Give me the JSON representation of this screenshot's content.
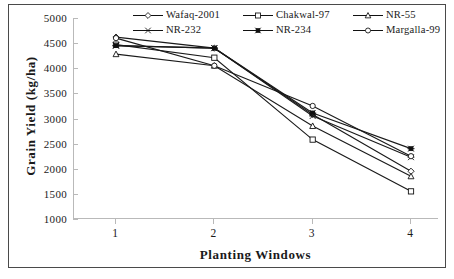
{
  "chart_data": {
    "type": "line",
    "title": "",
    "xlabel": "Planting Windows",
    "ylabel": "Grain Yield (kg/ha)",
    "categories": [
      "1",
      "2",
      "3",
      "4"
    ],
    "x": [
      1,
      2,
      3,
      4
    ],
    "ylim": [
      1000,
      5000
    ],
    "yticks": [
      1000,
      1500,
      2000,
      2500,
      3000,
      3500,
      4000,
      4500,
      5000
    ],
    "ytick_labels": [
      "1000",
      "1500",
      "2000",
      "2500",
      "3000",
      "3500",
      "4000",
      "4500",
      "5000"
    ],
    "grid": false,
    "legend_position": "top-inside",
    "series": [
      {
        "name": "Wafaq-2001",
        "marker": "diamond",
        "values": [
          4620,
          4400,
          3080,
          1950
        ]
      },
      {
        "name": "Chakwal-97",
        "marker": "square",
        "values": [
          4470,
          4210,
          2580,
          1550
        ]
      },
      {
        "name": "NR-55",
        "marker": "triangle",
        "values": [
          4280,
          4050,
          2850,
          1850
        ]
      },
      {
        "name": "NR-232",
        "marker": "cross",
        "values": [
          4450,
          4400,
          3050,
          2230
        ]
      },
      {
        "name": "NR-234",
        "marker": "star-filled",
        "values": [
          4450,
          4400,
          3110,
          2400
        ]
      },
      {
        "name": "Margalla-99",
        "marker": "circle",
        "values": [
          4600,
          4050,
          3250,
          2250
        ]
      }
    ]
  },
  "legend": {
    "items": [
      {
        "label": "Wafaq-2001",
        "marker": "diamond"
      },
      {
        "label": "Chakwal-97",
        "marker": "square"
      },
      {
        "label": "NR-55",
        "marker": "triangle"
      },
      {
        "label": "NR-232",
        "marker": "cross"
      },
      {
        "label": "NR-234",
        "marker": "star-filled"
      },
      {
        "label": "Margalla-99",
        "marker": "circle"
      }
    ]
  },
  "axes": {
    "x_title": "Planting Windows",
    "y_title": "Grain Yield (kg/ha)",
    "x_tick_labels": [
      "1",
      "2",
      "3",
      "4"
    ],
    "y_tick_labels": [
      "5000",
      "4500",
      "4000",
      "3500",
      "3000",
      "2500",
      "2000",
      "1500",
      "1000"
    ]
  },
  "colors": {
    "line": "#1a1a1a",
    "axis": "#b9b9b9",
    "frame": "#4a4a4a",
    "text": "#1a1a1a",
    "background": "#ffffff"
  }
}
